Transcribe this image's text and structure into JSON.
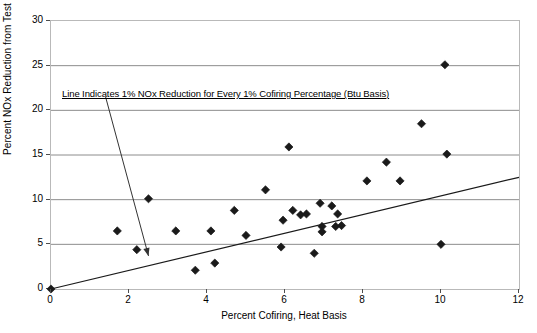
{
  "chart_data": {
    "type": "scatter",
    "title": "",
    "xlabel": "Percent Cofiring, Heat Basis",
    "ylabel": "Percent NOx Reduction from Test Baseline",
    "xlim": [
      0,
      12
    ],
    "ylim": [
      0,
      30
    ],
    "xticks": [
      0,
      2,
      4,
      6,
      8,
      10,
      12
    ],
    "yticks": [
      0,
      5,
      10,
      15,
      20,
      25,
      30
    ],
    "grid": "horizontal",
    "legend": "none",
    "annotations": [
      {
        "text": "Line Indicates 1% NOx Reduction for Every 1% Cofiring Percentage (Btu Basis)",
        "x": 1.4,
        "y": 21.5,
        "arrow_to": {
          "x": 2.5,
          "y": 3.7
        }
      }
    ],
    "reference_line": {
      "name": "one-to-one-line",
      "from": {
        "x": 0,
        "y": 0
      },
      "to": {
        "x": 12,
        "y": 12.5
      },
      "slope": 1.04
    },
    "series": [
      {
        "name": "Cofiring test data",
        "marker": "diamond",
        "color": "#1a1a1a",
        "points": [
          {
            "x": 0.0,
            "y": 0.0
          },
          {
            "x": 1.7,
            "y": 6.5
          },
          {
            "x": 2.2,
            "y": 4.4
          },
          {
            "x": 2.5,
            "y": 10.1
          },
          {
            "x": 3.2,
            "y": 6.5
          },
          {
            "x": 3.7,
            "y": 2.1
          },
          {
            "x": 4.1,
            "y": 6.5
          },
          {
            "x": 4.2,
            "y": 2.9
          },
          {
            "x": 4.7,
            "y": 8.8
          },
          {
            "x": 5.0,
            "y": 6.0
          },
          {
            "x": 5.5,
            "y": 11.1
          },
          {
            "x": 5.9,
            "y": 4.7
          },
          {
            "x": 5.95,
            "y": 7.7
          },
          {
            "x": 6.1,
            "y": 15.9
          },
          {
            "x": 6.2,
            "y": 8.8
          },
          {
            "x": 6.4,
            "y": 8.3
          },
          {
            "x": 6.55,
            "y": 8.4
          },
          {
            "x": 6.75,
            "y": 4.0
          },
          {
            "x": 6.9,
            "y": 9.6
          },
          {
            "x": 6.95,
            "y": 7.0
          },
          {
            "x": 6.95,
            "y": 6.4
          },
          {
            "x": 7.2,
            "y": 9.3
          },
          {
            "x": 7.35,
            "y": 8.4
          },
          {
            "x": 7.3,
            "y": 7.0
          },
          {
            "x": 7.45,
            "y": 7.1
          },
          {
            "x": 8.1,
            "y": 12.1
          },
          {
            "x": 8.6,
            "y": 14.2
          },
          {
            "x": 8.95,
            "y": 12.1
          },
          {
            "x": 9.5,
            "y": 18.5
          },
          {
            "x": 10.0,
            "y": 5.0
          },
          {
            "x": 10.1,
            "y": 25.1
          },
          {
            "x": 10.15,
            "y": 15.1
          }
        ]
      }
    ]
  },
  "axis": {
    "ylabel": "Percent NOx Reduction from Test Baseline",
    "xlabel": "Percent Cofiring, Heat Basis"
  },
  "annotation": {
    "text": "Line Indicates 1% NOx Reduction for Every 1% Cofiring Percentage (Btu Basis)"
  }
}
